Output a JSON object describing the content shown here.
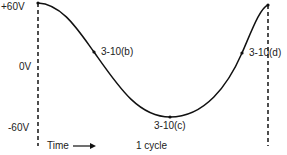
{
  "diagram": {
    "title": "",
    "y_labels": {
      "top": "+60V",
      "mid": "0V",
      "bottom": "-60V"
    },
    "x_labels": {
      "time": "Time",
      "period": "1 cycle"
    },
    "points": [
      {
        "id": "b",
        "label": "3-10(b)"
      },
      {
        "id": "c",
        "label": "3-10(c)"
      },
      {
        "id": "d",
        "label": "3-10(d)"
      }
    ],
    "colors": {
      "curve": "#111111",
      "dashed": "#222222",
      "text": "#222222"
    }
  }
}
